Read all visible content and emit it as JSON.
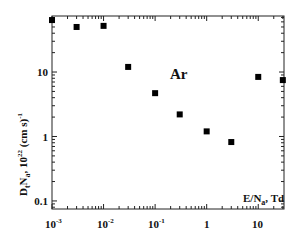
{
  "chart_data": {
    "type": "scatter",
    "title": "",
    "annotation": "Ar",
    "xlabel": "E/N_a , Td",
    "ylabel": "D_t N_a , 10^22 (cm s)^-1",
    "xscale": "log",
    "yscale": "log",
    "xlim": [
      0.001,
      31.6
    ],
    "ylim": [
      0.075,
      74
    ],
    "x_ticks": [
      "10^-3",
      "10^-2",
      "10^-1",
      "1",
      "10"
    ],
    "y_ticks": [
      "0.1",
      "1",
      "10"
    ],
    "grid": false,
    "legend": null,
    "series": [
      {
        "name": "Ar",
        "marker": "square",
        "color": "#000000",
        "x": [
          0.001,
          0.003,
          0.01,
          0.03,
          0.1,
          0.3,
          1,
          3,
          10,
          30
        ],
        "y": [
          64,
          50,
          52,
          12,
          4.7,
          2.2,
          1.2,
          0.82,
          8.4,
          7.5
        ]
      }
    ]
  },
  "labels": {
    "annotation": "Ar",
    "xlabel_main": "E/N",
    "xlabel_sub": "a",
    "xlabel_tail": ", Td",
    "ylabel_D": "D",
    "ylabel_t": "t",
    "ylabel_N": "N",
    "ylabel_a": "a",
    "ylabel_rest": ", 10",
    "ylabel_exp": "22",
    "ylabel_units": " (cm s)",
    "ylabel_unit_exp": "-1",
    "xtick_0": "10",
    "xtick_0_exp": "-3",
    "xtick_1": "10",
    "xtick_1_exp": "-2",
    "xtick_2": "10",
    "xtick_2_exp": "-1",
    "xtick_3": "1",
    "xtick_4": "10",
    "ytick_0": "0.1",
    "ytick_1": "1",
    "ytick_2": "10"
  }
}
